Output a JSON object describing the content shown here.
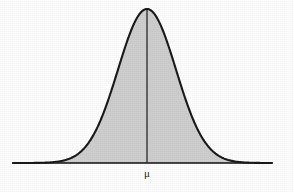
{
  "figure": {
    "name": "normal-distribution-curve",
    "width": 294,
    "height": 192,
    "background_color": "#ffffff"
  },
  "labels": {
    "mean_symbol": "μ",
    "mean_symbol_x": 147,
    "mean_symbol_y": 168
  },
  "style": {
    "curve_stroke_color": "#1a1a1a",
    "curve_stroke_width": 2.1,
    "fill_color": "#cfcfcf",
    "axis_color": "#111111",
    "axis_stroke_width": 1.6,
    "mean_line_color": "#2b2b2b",
    "mean_line_width": 1.3
  },
  "chart_data": {
    "type": "line",
    "title": "",
    "subtitle": "",
    "xlabel": "",
    "ylabel": "",
    "distribution": "normal",
    "mean_label": "μ",
    "grid": false,
    "legend": null,
    "axis": {
      "x_start_px": 13,
      "x_end_px": 272,
      "baseline_y_px": 163,
      "peak_x_px": 147,
      "peak_y_px": 9,
      "sigma_px": 29
    },
    "annotations": [
      {
        "text": "μ",
        "x_px": 147,
        "y_px": 175,
        "role": "mean-tick-label"
      }
    ],
    "series": [
      {
        "name": "normal-pdf",
        "filled": true,
        "x": [
          13,
          23,
          33,
          43,
          53,
          63,
          73,
          83,
          89,
          95,
          101,
          107,
          113,
          118,
          124,
          130,
          136,
          141,
          147,
          153,
          158,
          164,
          170,
          176,
          181,
          187,
          193,
          199,
          205,
          211,
          221,
          231,
          241,
          251,
          261,
          272
        ],
        "y": [
          163.0,
          162.9,
          162.8,
          162.5,
          161.8,
          160.2,
          157.0,
          151.3,
          146.4,
          140.4,
          133.2,
          124.9,
          115.5,
          106.3,
          95.6,
          84.9,
          74.8,
          66.2,
          57.9,
          51.2,
          46.5,
          42.2,
          39.6,
          38.5,
          39.5,
          42.0,
          46.3,
          51.1,
          57.7,
          66.0,
          84.7,
          106.1,
          128.0,
          146.2,
          157.0,
          162.6
        ]
      }
    ]
  }
}
